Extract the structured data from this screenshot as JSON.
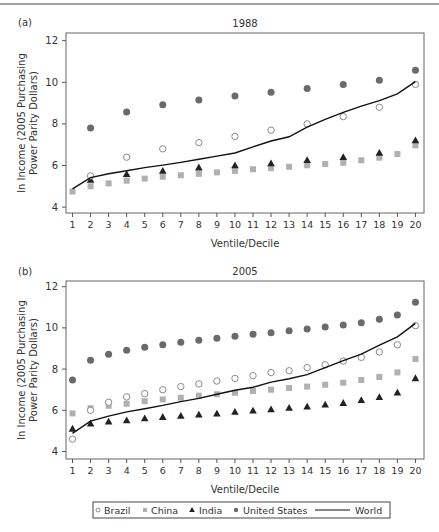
{
  "figure": {
    "legend": {
      "items": [
        {
          "name": "Brazil",
          "marker": "open-circle"
        },
        {
          "name": "China",
          "marker": "square"
        },
        {
          "name": "India",
          "marker": "triangle"
        },
        {
          "name": "United States",
          "marker": "filled-circle"
        },
        {
          "name": "World",
          "marker": "line"
        }
      ]
    },
    "colors": {
      "Brazil": "#8a8a8a",
      "China": "#b0b0b0",
      "India": "#222222",
      "United States": "#6a6a6a",
      "World": "#111111",
      "axis": "#555555"
    }
  },
  "chart_data": [
    {
      "panel_label": "(a)",
      "type": "scatter",
      "title": "1988",
      "xlabel": "Ventile/Decile",
      "ylabel": "ln Income (2005 Purchasing Power Parity Dollars)",
      "ylim": [
        4,
        12
      ],
      "yticks": [
        4,
        6,
        8,
        10,
        12
      ],
      "x": [
        1,
        2,
        3,
        4,
        5,
        6,
        7,
        8,
        9,
        10,
        11,
        12,
        13,
        14,
        15,
        16,
        17,
        18,
        19,
        20
      ],
      "grid": false,
      "series": [
        {
          "name": "Brazil",
          "marker": "open-circle",
          "x": [
            2,
            4,
            6,
            8,
            10,
            12,
            14,
            16,
            18,
            20
          ],
          "values": [
            5.5,
            6.4,
            6.8,
            7.1,
            7.4,
            7.7,
            8.0,
            8.35,
            8.8,
            9.9
          ]
        },
        {
          "name": "China",
          "marker": "square",
          "x": [
            1,
            2,
            3,
            4,
            5,
            6,
            7,
            8,
            9,
            10,
            11,
            12,
            13,
            14,
            15,
            16,
            17,
            18,
            19,
            20
          ],
          "values": [
            4.75,
            5.0,
            5.14,
            5.27,
            5.37,
            5.46,
            5.53,
            5.6,
            5.67,
            5.74,
            5.82,
            5.87,
            5.94,
            6.01,
            6.07,
            6.13,
            6.25,
            6.38,
            6.55,
            6.97
          ]
        },
        {
          "name": "India",
          "marker": "triangle",
          "x": [
            2,
            4,
            6,
            8,
            10,
            12,
            14,
            16,
            18,
            20
          ],
          "values": [
            5.3,
            5.58,
            5.74,
            5.9,
            6.0,
            6.1,
            6.25,
            6.4,
            6.6,
            7.2
          ]
        },
        {
          "name": "United States",
          "marker": "filled-circle",
          "x": [
            2,
            4,
            6,
            8,
            10,
            12,
            14,
            16,
            18,
            20
          ],
          "values": [
            7.8,
            8.57,
            8.92,
            9.15,
            9.34,
            9.52,
            9.7,
            9.9,
            10.1,
            10.58
          ]
        },
        {
          "name": "World",
          "marker": "line",
          "x": [
            1,
            2,
            3,
            4,
            5,
            6,
            7,
            8,
            9,
            10,
            11,
            12,
            13,
            14,
            15,
            16,
            17,
            18,
            19,
            20
          ],
          "values": [
            4.88,
            5.42,
            5.6,
            5.75,
            5.9,
            6.02,
            6.15,
            6.3,
            6.45,
            6.6,
            6.9,
            7.18,
            7.38,
            7.84,
            8.22,
            8.56,
            8.85,
            9.12,
            9.44,
            10.03
          ]
        }
      ]
    },
    {
      "panel_label": "(b)",
      "type": "scatter",
      "title": "2005",
      "xlabel": "Ventile/Decile",
      "ylabel": "ln Income (2005 Purchasing Power Parity Dollars)",
      "ylim": [
        4,
        12
      ],
      "yticks": [
        4,
        6,
        8,
        10,
        12
      ],
      "x": [
        1,
        2,
        3,
        4,
        5,
        6,
        7,
        8,
        9,
        10,
        11,
        12,
        13,
        14,
        15,
        16,
        17,
        18,
        19,
        20
      ],
      "grid": false,
      "series": [
        {
          "name": "Brazil",
          "marker": "open-circle",
          "x": [
            1,
            2,
            3,
            4,
            5,
            6,
            7,
            8,
            9,
            10,
            11,
            12,
            13,
            14,
            15,
            16,
            17,
            18,
            19,
            20
          ],
          "values": [
            4.6,
            6.0,
            6.39,
            6.65,
            6.81,
            7.0,
            7.15,
            7.28,
            7.42,
            7.55,
            7.68,
            7.83,
            7.92,
            8.07,
            8.21,
            8.39,
            8.57,
            8.83,
            9.18,
            10.11
          ]
        },
        {
          "name": "China",
          "marker": "square",
          "x": [
            1,
            2,
            3,
            4,
            5,
            6,
            7,
            8,
            9,
            10,
            11,
            12,
            13,
            14,
            15,
            16,
            17,
            18,
            19,
            20
          ],
          "values": [
            5.85,
            6.1,
            6.22,
            6.32,
            6.44,
            6.53,
            6.61,
            6.71,
            6.78,
            6.85,
            6.94,
            7.0,
            7.08,
            7.15,
            7.24,
            7.34,
            7.47,
            7.62,
            7.84,
            8.49
          ]
        },
        {
          "name": "India",
          "marker": "triangle",
          "x": [
            1,
            2,
            3,
            4,
            5,
            6,
            7,
            8,
            9,
            10,
            11,
            12,
            13,
            14,
            15,
            16,
            17,
            18,
            19,
            20
          ],
          "values": [
            5.1,
            5.35,
            5.45,
            5.51,
            5.6,
            5.67,
            5.72,
            5.79,
            5.83,
            5.92,
            5.98,
            6.04,
            6.11,
            6.17,
            6.27,
            6.35,
            6.49,
            6.63,
            6.85,
            7.55
          ]
        },
        {
          "name": "United States",
          "marker": "filled-circle",
          "x": [
            1,
            2,
            3,
            4,
            5,
            6,
            7,
            8,
            9,
            10,
            11,
            12,
            13,
            14,
            15,
            16,
            17,
            18,
            19,
            20
          ],
          "values": [
            7.47,
            8.43,
            8.72,
            8.91,
            9.06,
            9.18,
            9.3,
            9.4,
            9.5,
            9.59,
            9.69,
            9.77,
            9.86,
            9.95,
            10.04,
            10.14,
            10.25,
            10.42,
            10.63,
            11.24
          ]
        },
        {
          "name": "World",
          "marker": "line",
          "x": [
            1,
            2,
            3,
            4,
            5,
            6,
            7,
            8,
            9,
            10,
            11,
            12,
            13,
            14,
            15,
            16,
            17,
            18,
            19,
            20
          ],
          "values": [
            4.88,
            5.47,
            5.72,
            5.92,
            6.08,
            6.24,
            6.42,
            6.58,
            6.78,
            6.97,
            7.12,
            7.37,
            7.53,
            7.73,
            8.07,
            8.41,
            8.73,
            9.16,
            9.57,
            10.22
          ]
        }
      ]
    }
  ]
}
